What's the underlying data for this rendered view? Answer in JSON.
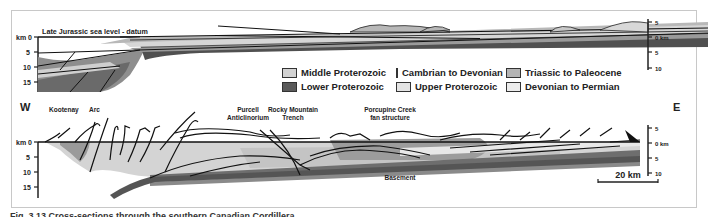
{
  "figure": {
    "upper_section": {
      "datum_label": "Late Jurassic sea level - datum",
      "left_axis": {
        "unit_label": "km 0",
        "ticks": [
          "km 0",
          "5",
          "10",
          "15"
        ]
      },
      "right_axis": {
        "ticks": [
          "5",
          "0 km",
          "5",
          "10"
        ]
      }
    },
    "legend": {
      "items": [
        {
          "label": "Middle Proterozoic",
          "color": "#d2d2d2"
        },
        {
          "label": "Cambrian to Devonian",
          "color": "#9a9a9a"
        },
        {
          "label": "Triassic to Paleocene",
          "color": "#b4b4b4"
        },
        {
          "label": "Lower Proterozoic",
          "color": "#5a5a5a"
        },
        {
          "label": "Upper Proterozoic",
          "color": "#e4e4e4"
        },
        {
          "label": "Devonian to Permian",
          "color": "#ececec"
        }
      ]
    },
    "lower_section": {
      "west_label": "W",
      "east_label": "E",
      "annotations": {
        "kootenay": "Kootenay",
        "arc": "Arc",
        "purcell_line1": "Purcell",
        "purcell_line2": "Anticlinorium",
        "rmt_line1": "Rocky Mountain",
        "rmt_line2": "Trench",
        "porcupine_line1": "Porcupine Creek",
        "porcupine_line2": "fan structure",
        "basement": "Basement"
      },
      "left_axis": {
        "ticks": [
          "km 0",
          "5",
          "10",
          "15"
        ]
      },
      "right_axis": {
        "ticks": [
          "5",
          "0 km",
          "5",
          "10"
        ]
      },
      "scale_bar": "20 km"
    },
    "caption": "Fig. 3.13 Cross-sections through the southern Canadian Cordillera"
  }
}
